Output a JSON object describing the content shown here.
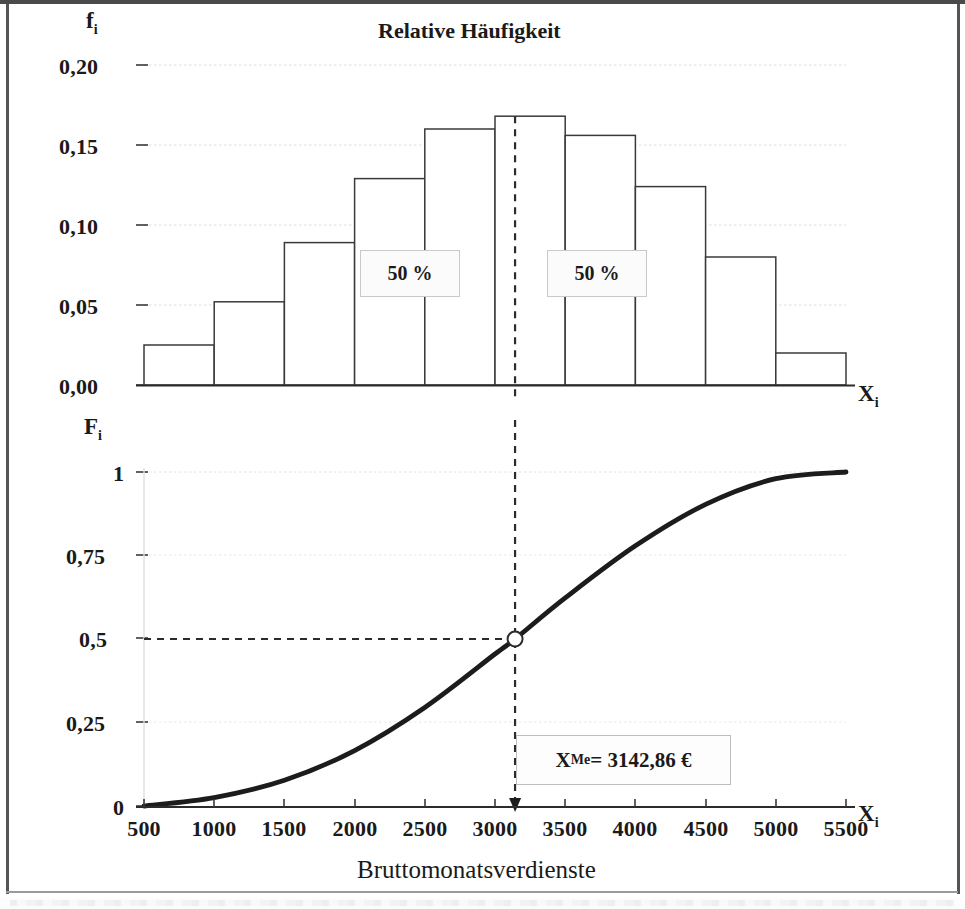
{
  "figure": {
    "title": "Relative Häufigkeit",
    "xlabel": "Bruttomonatsverdienste"
  },
  "upper": {
    "y_axis_name": "f",
    "y_axis_name_sub": "i",
    "x_axis_name": "X",
    "x_axis_name_sub": "i",
    "y_ticks": [
      "0,20",
      "0,15",
      "0,10",
      "0,05",
      "0,00"
    ],
    "annotations": [
      {
        "label": "50 %"
      },
      {
        "label": "50 %"
      }
    ]
  },
  "lower": {
    "y_axis_name": "F",
    "y_axis_name_sub": "i",
    "x_axis_name": "X",
    "x_axis_name_sub": "i",
    "y_ticks": [
      "1",
      "0,75",
      "0,5",
      "0,25",
      "0"
    ],
    "x_ticks": [
      "500",
      "1000",
      "1500",
      "2000",
      "2500",
      "3000",
      "3500",
      "4000",
      "4500",
      "5000",
      "5500"
    ],
    "median_label": "X",
    "median_label_sub": "Me",
    "median_label_value": " = 3142,86 €"
  },
  "chart_data": [
    {
      "type": "bar",
      "title": "Relative Häufigkeit",
      "xlabel": "Bruttomonatsverdienste",
      "ylabel": "f_i",
      "categories": [
        "500-1000",
        "1000-1500",
        "1500-2000",
        "2000-2500",
        "2500-3000",
        "3000-3500",
        "3500-4000",
        "4000-4500",
        "4500-5000",
        "5000-5500"
      ],
      "bin_edges": [
        500,
        1000,
        1500,
        2000,
        2500,
        3000,
        3500,
        4000,
        4500,
        5000,
        5500
      ],
      "values": [
        0.025,
        0.052,
        0.089,
        0.129,
        0.16,
        0.168,
        0.156,
        0.124,
        0.08,
        0.02
      ],
      "ylim": [
        0,
        0.2
      ],
      "xlim": [
        500,
        5500
      ],
      "ytick_labels": [
        "0,00",
        "0,05",
        "0,10",
        "0,15",
        "0,20"
      ],
      "ytick_values": [
        0,
        0.05,
        0.1,
        0.15,
        0.2
      ],
      "grid": true,
      "legend": "none",
      "annotations": [
        {
          "text": "50 %",
          "x": 2250,
          "y": 0.0845
        },
        {
          "text": "50 %",
          "x": 3590,
          "y": 0.0845
        }
      ],
      "median_line_x": 3142.86
    },
    {
      "type": "line",
      "title": "Kumulierte relative Häufigkeit (Summenkurve)",
      "xlabel": "Bruttomonatsverdienste",
      "ylabel": "F_i",
      "x": [
        500,
        1000,
        1500,
        2000,
        2500,
        3000,
        3142.86,
        3500,
        4000,
        4500,
        5000,
        5500
      ],
      "values": [
        0.0,
        0.025,
        0.077,
        0.166,
        0.295,
        0.455,
        0.5,
        0.623,
        0.779,
        0.903,
        0.98,
        1.0
      ],
      "ylim": [
        0,
        1
      ],
      "xlim": [
        500,
        5500
      ],
      "ytick_labels": [
        "0",
        "0,25",
        "0,5",
        "0,75",
        "1"
      ],
      "ytick_values": [
        0,
        0.25,
        0.5,
        0.75,
        1
      ],
      "xtick_labels": [
        "500",
        "1000",
        "1500",
        "2000",
        "2500",
        "3000",
        "3500",
        "4000",
        "4500",
        "5000",
        "5500"
      ],
      "xtick_values": [
        500,
        1000,
        1500,
        2000,
        2500,
        3000,
        3500,
        4000,
        4500,
        5000,
        5500
      ],
      "grid": true,
      "legend": "none",
      "annotations": [
        {
          "text": "X_Me = 3142,86 €",
          "x": 3142.86,
          "y": 0.5,
          "marker": "open-circle"
        }
      ],
      "median_x": 3142.86,
      "median_y": 0.5
    }
  ],
  "colors": {
    "line": "#1c1c1c",
    "bar_stroke": "#3a3a3a",
    "grid": "#d8d8d8",
    "axis": "#2b2b2b",
    "dashed": "#2b2b2b",
    "callout_bg": "#fbfbfb",
    "callout_border": "#c9c9c9"
  }
}
